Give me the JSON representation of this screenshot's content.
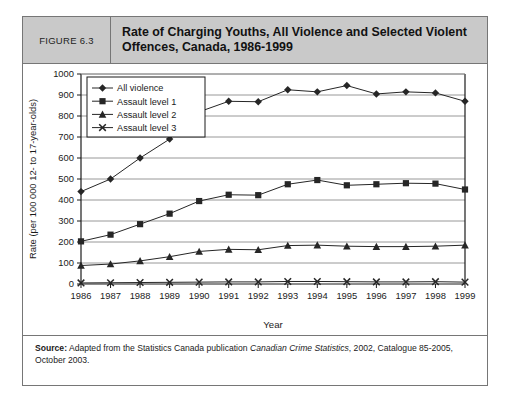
{
  "figure": {
    "number_label": "FIGURE 6.3",
    "title": "Rate of Charging Youths, All Violence and Selected Violent Offences, Canada, 1986-1999"
  },
  "source": {
    "label": "Source:",
    "text_before_italic": " Adapted from the Statistics Canada publication ",
    "italic_text": "Canadian Crime Statistics",
    "text_after_italic": ", 2002, Catalogue 85-2005, October 2003."
  },
  "chart_data": {
    "type": "line",
    "title": "Rate of Charging Youths, All Violence and Selected Violent Offences, Canada, 1986-1999",
    "xlabel": "Year",
    "ylabel": "Rate (per 100 000 12- to 17-year-olds)",
    "categories": [
      "1986",
      "1987",
      "1988",
      "1989",
      "1990",
      "1991",
      "1992",
      "1993",
      "1994",
      "1995",
      "1996",
      "1997",
      "1998",
      "1999"
    ],
    "x": [
      1986,
      1987,
      1988,
      1989,
      1990,
      1991,
      1992,
      1993,
      1994,
      1995,
      1996,
      1997,
      1998,
      1999
    ],
    "ylim": [
      0,
      1000
    ],
    "ytick_step": 100,
    "yticks": [
      0,
      100,
      200,
      300,
      400,
      500,
      600,
      700,
      800,
      900,
      1000
    ],
    "grid": "horizontal",
    "legend_position": "top-left-inside",
    "series": [
      {
        "name": "All violence",
        "marker": "diamond",
        "values": [
          440,
          500,
          600,
          690,
          820,
          870,
          868,
          925,
          915,
          945,
          905,
          915,
          910,
          870
        ]
      },
      {
        "name": "Assault level 1",
        "marker": "square",
        "values": [
          203,
          235,
          285,
          335,
          395,
          425,
          423,
          475,
          495,
          470,
          475,
          480,
          478,
          450
        ]
      },
      {
        "name": "Assault level 2",
        "marker": "triangle",
        "values": [
          88,
          95,
          110,
          130,
          155,
          165,
          163,
          183,
          185,
          180,
          178,
          178,
          180,
          185
        ]
      },
      {
        "name": "Assault level 3",
        "marker": "cross",
        "values": [
          5,
          6,
          7,
          8,
          9,
          10,
          10,
          12,
          12,
          11,
          10,
          10,
          11,
          9
        ]
      }
    ]
  },
  "colors": {
    "header_band": "#c9c9c9",
    "border": "#767676",
    "series_line": "#262626",
    "gridline": "#8c8c8c",
    "axis": "#1b1b1b"
  }
}
